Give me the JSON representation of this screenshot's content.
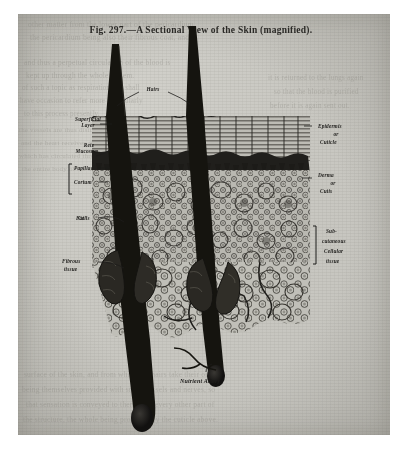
{
  "figure": {
    "caption": "Fig. 297.—A Sectional View of the Skin (magnified).",
    "caption_number": "Fig. 297.",
    "caption_title": "A Sectional View of the Skin (magnified)."
  },
  "labels": {
    "hairs": "Hairs",
    "superficial_layer_1": "Superficial",
    "superficial_layer_2": "Layer",
    "rete_mucosum_1": "Rete",
    "rete_mucosum_2": "Mucosum",
    "papillae": "Papillae",
    "corium": "Corium",
    "fat_cells_1": "Fat",
    "fat_cells_2": "Cells",
    "fibrous_tissue_1": "Fibrous",
    "fibrous_tissue_2": "tissue",
    "epidermis_1": "Epidermis",
    "epidermis_2": "or",
    "epidermis_3": "Cuticle",
    "derma_1": "Derma",
    "derma_2": "or",
    "derma_3": "Cutis",
    "subcutaneous_1": "Sub-",
    "subcutaneous_2": "cutaneous",
    "subcutaneous_3": "Cellular",
    "subcutaneous_4": "tissue",
    "nutrient_artery": "Nutrient Artery"
  },
  "ghost_text": {
    "l1": "other matter from the lower part of the pericardium,",
    "l2": "the pericardium being also their fibrous coat, and",
    "l3": "and thus a perpetual circulation of the blood is",
    "l4": "kept up through the whole system.",
    "l5": "of such a topic as respiration, we shall",
    "l6": "have occasion to refer more particularly",
    "l7": "to this process presently.",
    "l8": "the vessels are thus distributed",
    "l9": "and the heart receives the blood",
    "l10": "which has circulated through",
    "l11": "the entire body of the animal.",
    "l12": "it is returned to the lungs again",
    "l13": "so that the blood is purified",
    "l14": "before it is again sent out.",
    "b1": "surface of the skin, and from which the hairs take their origin,",
    "b2": "being themselves provided with small vessels and nerves, so",
    "b3": "that sensation is conveyed to them as to every other part of",
    "b4": "the structure, the whole being protected by the cuticle above."
  },
  "colors": {
    "paper": "#c9c8c2",
    "ink": "#1d1c1a",
    "engraving_dark": "#1a1917",
    "engraving_mid": "#4a4843",
    "ghost": "#8f8d86"
  }
}
